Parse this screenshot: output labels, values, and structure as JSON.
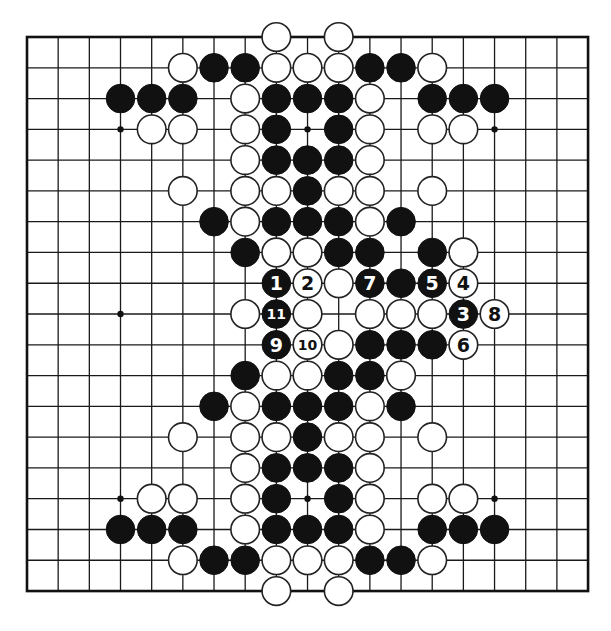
{
  "board": {
    "size": 19,
    "origin_x": 27,
    "origin_y": 37,
    "spacing_x": 31.17,
    "spacing_y": 30.78,
    "stone_radius": 14.3,
    "colors": {
      "line": "#1a1a1a",
      "black": "#111111",
      "white": "#ffffff",
      "background": "#ffffff"
    },
    "star_points": [
      [
        3,
        3
      ],
      [
        9,
        3
      ],
      [
        15,
        3
      ],
      [
        3,
        9
      ],
      [
        3,
        15
      ],
      [
        9,
        15
      ],
      [
        15,
        15
      ]
    ],
    "stones": [
      {
        "c": 8,
        "r": 0,
        "color": "W"
      },
      {
        "c": 10,
        "r": 0,
        "color": "W"
      },
      {
        "c": 5,
        "r": 1,
        "color": "W"
      },
      {
        "c": 6,
        "r": 1,
        "color": "B"
      },
      {
        "c": 7,
        "r": 1,
        "color": "B"
      },
      {
        "c": 8,
        "r": 1,
        "color": "W"
      },
      {
        "c": 9,
        "r": 1,
        "color": "W"
      },
      {
        "c": 10,
        "r": 1,
        "color": "W"
      },
      {
        "c": 11,
        "r": 1,
        "color": "B"
      },
      {
        "c": 12,
        "r": 1,
        "color": "B"
      },
      {
        "c": 13,
        "r": 1,
        "color": "W"
      },
      {
        "c": 3,
        "r": 2,
        "color": "B"
      },
      {
        "c": 4,
        "r": 2,
        "color": "B"
      },
      {
        "c": 5,
        "r": 2,
        "color": "B"
      },
      {
        "c": 7,
        "r": 2,
        "color": "W"
      },
      {
        "c": 8,
        "r": 2,
        "color": "B"
      },
      {
        "c": 9,
        "r": 2,
        "color": "B"
      },
      {
        "c": 10,
        "r": 2,
        "color": "B"
      },
      {
        "c": 11,
        "r": 2,
        "color": "W"
      },
      {
        "c": 13,
        "r": 2,
        "color": "B"
      },
      {
        "c": 14,
        "r": 2,
        "color": "B"
      },
      {
        "c": 15,
        "r": 2,
        "color": "B"
      },
      {
        "c": 4,
        "r": 3,
        "color": "W"
      },
      {
        "c": 5,
        "r": 3,
        "color": "W"
      },
      {
        "c": 7,
        "r": 3,
        "color": "W"
      },
      {
        "c": 8,
        "r": 3,
        "color": "B"
      },
      {
        "c": 10,
        "r": 3,
        "color": "B"
      },
      {
        "c": 11,
        "r": 3,
        "color": "W"
      },
      {
        "c": 13,
        "r": 3,
        "color": "W"
      },
      {
        "c": 14,
        "r": 3,
        "color": "W"
      },
      {
        "c": 7,
        "r": 4,
        "color": "W"
      },
      {
        "c": 8,
        "r": 4,
        "color": "B"
      },
      {
        "c": 9,
        "r": 4,
        "color": "B"
      },
      {
        "c": 10,
        "r": 4,
        "color": "B"
      },
      {
        "c": 11,
        "r": 4,
        "color": "W"
      },
      {
        "c": 5,
        "r": 5,
        "color": "W"
      },
      {
        "c": 7,
        "r": 5,
        "color": "W"
      },
      {
        "c": 8,
        "r": 5,
        "color": "W"
      },
      {
        "c": 9,
        "r": 5,
        "color": "B"
      },
      {
        "c": 10,
        "r": 5,
        "color": "W"
      },
      {
        "c": 11,
        "r": 5,
        "color": "W"
      },
      {
        "c": 13,
        "r": 5,
        "color": "W"
      },
      {
        "c": 6,
        "r": 6,
        "color": "B"
      },
      {
        "c": 7,
        "r": 6,
        "color": "W"
      },
      {
        "c": 8,
        "r": 6,
        "color": "B"
      },
      {
        "c": 9,
        "r": 6,
        "color": "B"
      },
      {
        "c": 10,
        "r": 6,
        "color": "B"
      },
      {
        "c": 11,
        "r": 6,
        "color": "W"
      },
      {
        "c": 12,
        "r": 6,
        "color": "B"
      },
      {
        "c": 7,
        "r": 7,
        "color": "B"
      },
      {
        "c": 8,
        "r": 7,
        "color": "W"
      },
      {
        "c": 9,
        "r": 7,
        "color": "W"
      },
      {
        "c": 10,
        "r": 7,
        "color": "B"
      },
      {
        "c": 11,
        "r": 7,
        "color": "B"
      },
      {
        "c": 13,
        "r": 7,
        "color": "B"
      },
      {
        "c": 14,
        "r": 7,
        "color": "W"
      },
      {
        "c": 8,
        "r": 8,
        "color": "B",
        "label": "1"
      },
      {
        "c": 9,
        "r": 8,
        "color": "W",
        "label": "2"
      },
      {
        "c": 10,
        "r": 8,
        "color": "W"
      },
      {
        "c": 11,
        "r": 8,
        "color": "B",
        "label": "7"
      },
      {
        "c": 12,
        "r": 8,
        "color": "B"
      },
      {
        "c": 13,
        "r": 8,
        "color": "B",
        "label": "5"
      },
      {
        "c": 14,
        "r": 8,
        "color": "W",
        "label": "4"
      },
      {
        "c": 7,
        "r": 9,
        "color": "W"
      },
      {
        "c": 8,
        "r": 9,
        "color": "B",
        "label": "11"
      },
      {
        "c": 9,
        "r": 9,
        "color": "W"
      },
      {
        "c": 11,
        "r": 9,
        "color": "W"
      },
      {
        "c": 12,
        "r": 9,
        "color": "W"
      },
      {
        "c": 13,
        "r": 9,
        "color": "W"
      },
      {
        "c": 14,
        "r": 9,
        "color": "B",
        "label": "3"
      },
      {
        "c": 15,
        "r": 9,
        "color": "W",
        "label": "8"
      },
      {
        "c": 8,
        "r": 10,
        "color": "B",
        "label": "9"
      },
      {
        "c": 9,
        "r": 10,
        "color": "W",
        "label": "10"
      },
      {
        "c": 10,
        "r": 10,
        "color": "W"
      },
      {
        "c": 11,
        "r": 10,
        "color": "B"
      },
      {
        "c": 12,
        "r": 10,
        "color": "B"
      },
      {
        "c": 13,
        "r": 10,
        "color": "B"
      },
      {
        "c": 14,
        "r": 10,
        "color": "W",
        "label": "6"
      },
      {
        "c": 7,
        "r": 11,
        "color": "B"
      },
      {
        "c": 8,
        "r": 11,
        "color": "W"
      },
      {
        "c": 9,
        "r": 11,
        "color": "W"
      },
      {
        "c": 10,
        "r": 11,
        "color": "B"
      },
      {
        "c": 11,
        "r": 11,
        "color": "B"
      },
      {
        "c": 12,
        "r": 11,
        "color": "W"
      },
      {
        "c": 6,
        "r": 12,
        "color": "B"
      },
      {
        "c": 7,
        "r": 12,
        "color": "W"
      },
      {
        "c": 8,
        "r": 12,
        "color": "B"
      },
      {
        "c": 9,
        "r": 12,
        "color": "B"
      },
      {
        "c": 10,
        "r": 12,
        "color": "B"
      },
      {
        "c": 11,
        "r": 12,
        "color": "W"
      },
      {
        "c": 12,
        "r": 12,
        "color": "B"
      },
      {
        "c": 5,
        "r": 13,
        "color": "W"
      },
      {
        "c": 7,
        "r": 13,
        "color": "W"
      },
      {
        "c": 8,
        "r": 13,
        "color": "W"
      },
      {
        "c": 9,
        "r": 13,
        "color": "B"
      },
      {
        "c": 10,
        "r": 13,
        "color": "W"
      },
      {
        "c": 11,
        "r": 13,
        "color": "W"
      },
      {
        "c": 13,
        "r": 13,
        "color": "W"
      },
      {
        "c": 7,
        "r": 14,
        "color": "W"
      },
      {
        "c": 8,
        "r": 14,
        "color": "B"
      },
      {
        "c": 9,
        "r": 14,
        "color": "B"
      },
      {
        "c": 10,
        "r": 14,
        "color": "B"
      },
      {
        "c": 11,
        "r": 14,
        "color": "W"
      },
      {
        "c": 4,
        "r": 15,
        "color": "W"
      },
      {
        "c": 5,
        "r": 15,
        "color": "W"
      },
      {
        "c": 7,
        "r": 15,
        "color": "W"
      },
      {
        "c": 8,
        "r": 15,
        "color": "B"
      },
      {
        "c": 10,
        "r": 15,
        "color": "B"
      },
      {
        "c": 11,
        "r": 15,
        "color": "W"
      },
      {
        "c": 13,
        "r": 15,
        "color": "W"
      },
      {
        "c": 14,
        "r": 15,
        "color": "W"
      },
      {
        "c": 3,
        "r": 16,
        "color": "B"
      },
      {
        "c": 4,
        "r": 16,
        "color": "B"
      },
      {
        "c": 5,
        "r": 16,
        "color": "B"
      },
      {
        "c": 7,
        "r": 16,
        "color": "W"
      },
      {
        "c": 8,
        "r": 16,
        "color": "B"
      },
      {
        "c": 9,
        "r": 16,
        "color": "B"
      },
      {
        "c": 10,
        "r": 16,
        "color": "B"
      },
      {
        "c": 11,
        "r": 16,
        "color": "W"
      },
      {
        "c": 13,
        "r": 16,
        "color": "B"
      },
      {
        "c": 14,
        "r": 16,
        "color": "B"
      },
      {
        "c": 15,
        "r": 16,
        "color": "B"
      },
      {
        "c": 5,
        "r": 17,
        "color": "W"
      },
      {
        "c": 6,
        "r": 17,
        "color": "B"
      },
      {
        "c": 7,
        "r": 17,
        "color": "B"
      },
      {
        "c": 8,
        "r": 17,
        "color": "W"
      },
      {
        "c": 9,
        "r": 17,
        "color": "W"
      },
      {
        "c": 10,
        "r": 17,
        "color": "W"
      },
      {
        "c": 11,
        "r": 17,
        "color": "B"
      },
      {
        "c": 12,
        "r": 17,
        "color": "B"
      },
      {
        "c": 13,
        "r": 17,
        "color": "W"
      },
      {
        "c": 8,
        "r": 18,
        "color": "W"
      },
      {
        "c": 10,
        "r": 18,
        "color": "W"
      }
    ]
  }
}
